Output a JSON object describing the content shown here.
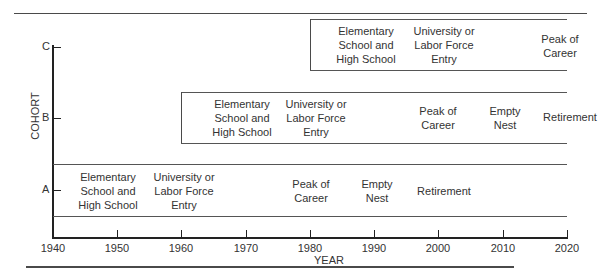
{
  "diagram": {
    "type": "cohort-life-stage-timeline",
    "x_axis": {
      "title": "YEAR",
      "ticks": [
        "1940",
        "1950",
        "1960",
        "1970",
        "1980",
        "1990",
        "2000",
        "2010",
        "2020"
      ]
    },
    "y_axis": {
      "title": "COHORT",
      "ticks": [
        "A",
        "B",
        "C"
      ]
    },
    "cohorts": [
      {
        "id": "A",
        "span": [
          1940,
          2020
        ],
        "stages": [
          {
            "label": "Elementary\nSchool and\nHigh School",
            "year": 1950
          },
          {
            "label": "University or\nLabor Force\nEntry",
            "year": 1960
          },
          {
            "label": "Peak of\nCareer",
            "year": 1980
          },
          {
            "label": "Empty\nNest",
            "year": 1990
          },
          {
            "label": "Retirement",
            "year": 2000
          }
        ]
      },
      {
        "id": "B",
        "span": [
          1960,
          2020
        ],
        "stages": [
          {
            "label": "Elementary\nSchool and\nHigh School",
            "year": 1970
          },
          {
            "label": "University or\nLabor Force\nEntry",
            "year": 1980
          },
          {
            "label": "Peak of\nCareer",
            "year": 2000
          },
          {
            "label": "Empty\nNest",
            "year": 2010
          },
          {
            "label": "Retirement",
            "year": 2020
          }
        ]
      },
      {
        "id": "C",
        "span": [
          1980,
          2020
        ],
        "stages": [
          {
            "label": "Elementary\nSchool and\nHigh School",
            "year": 1990
          },
          {
            "label": "University or\nLabor Force\nEntry",
            "year": 2000
          },
          {
            "label": "Peak of\nCareer",
            "year": 2020
          }
        ]
      }
    ]
  }
}
